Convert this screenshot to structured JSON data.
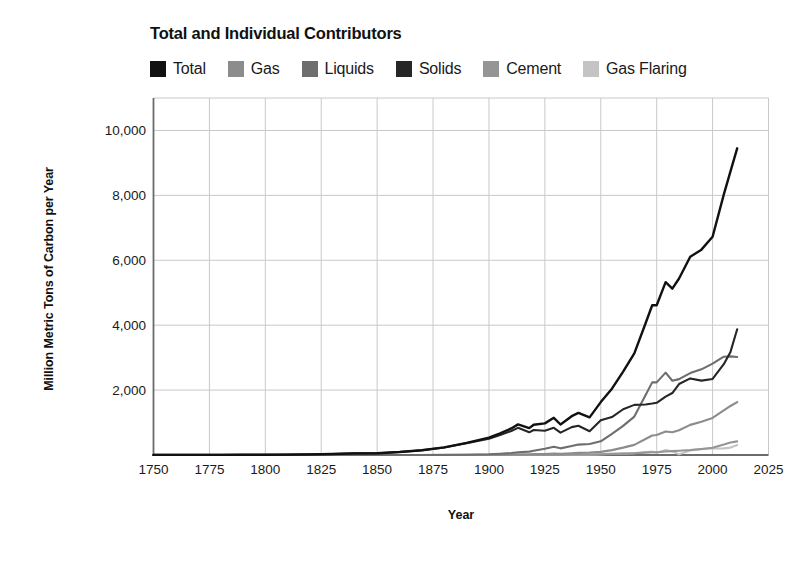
{
  "chart_data": {
    "type": "line",
    "title": "Total and Individual Contributors",
    "xlabel": "Year",
    "ylabel": "Million Metric Tons of Carbon per Year",
    "xlim": [
      1750,
      2025
    ],
    "ylim": [
      0,
      11000
    ],
    "xticks": [
      1750,
      1775,
      1800,
      1825,
      1850,
      1875,
      1900,
      1925,
      1950,
      1975,
      2000,
      2025
    ],
    "xtick_labels": [
      "1750",
      "1775",
      "1800",
      "1825",
      "1850",
      "1875",
      "1900",
      "1925",
      "1950",
      "1975",
      "2000",
      "2025"
    ],
    "yticks": [
      2000,
      4000,
      6000,
      8000,
      10000
    ],
    "ytick_labels": [
      "2,000",
      "4,000",
      "6,000",
      "8,000",
      "10,000"
    ],
    "grid": true,
    "legend_position": "top",
    "x": [
      1750,
      1760,
      1770,
      1780,
      1790,
      1800,
      1810,
      1820,
      1830,
      1840,
      1850,
      1860,
      1870,
      1880,
      1890,
      1900,
      1905,
      1910,
      1913,
      1918,
      1920,
      1925,
      1929,
      1932,
      1937,
      1940,
      1945,
      1950,
      1955,
      1960,
      1965,
      1970,
      1973,
      1975,
      1979,
      1982,
      1985,
      1990,
      1995,
      2000,
      2005,
      2008,
      2011
    ],
    "series": [
      {
        "name": "Total",
        "color": "#111111",
        "values": [
          3,
          3,
          4,
          5,
          8,
          8,
          13,
          18,
          31,
          50,
          54,
          91,
          147,
          236,
          375,
          534,
          670,
          819,
          944,
          827,
          932,
          975,
          1145,
          940,
          1196,
          1299,
          1160,
          1630,
          2043,
          2569,
          3130,
          4053,
          4613,
          4615,
          5326,
          5127,
          5438,
          6109,
          6327,
          6724,
          8023,
          8738,
          9449
        ]
      },
      {
        "name": "Gas",
        "color": "#8c8c8c",
        "values": [
          0,
          0,
          0,
          0,
          0,
          0,
          0,
          0,
          0,
          0,
          0,
          0,
          0,
          1,
          3,
          9,
          13,
          18,
          22,
          22,
          26,
          33,
          47,
          38,
          54,
          64,
          74,
          97,
          150,
          227,
          312,
          493,
          600,
          614,
          724,
          699,
          764,
          928,
          1027,
          1143,
          1372,
          1510,
          1630
        ]
      },
      {
        "name": "Liquids",
        "color": "#6e6e6e",
        "values": [
          0,
          0,
          0,
          0,
          0,
          0,
          0,
          0,
          0,
          0,
          0,
          0,
          1,
          3,
          10,
          24,
          39,
          60,
          83,
          104,
          131,
          191,
          254,
          205,
          275,
          321,
          341,
          423,
          653,
          898,
          1184,
          1839,
          2238,
          2237,
          2537,
          2289,
          2338,
          2525,
          2639,
          2815,
          3029,
          3038,
          3020
        ]
      },
      {
        "name": "Solids",
        "color": "#262626",
        "values": [
          3,
          3,
          4,
          5,
          8,
          8,
          13,
          18,
          31,
          50,
          54,
          91,
          146,
          232,
          362,
          501,
          617,
          739,
          837,
          699,
          772,
          747,
          836,
          688,
          858,
          903,
          733,
          1070,
          1170,
          1410,
          1544,
          1556,
          1586,
          1609,
          1799,
          1910,
          2186,
          2360,
          2292,
          2342,
          2797,
          3177,
          3873
        ]
      },
      {
        "name": "Cement",
        "color": "#959595",
        "values": [
          0,
          0,
          0,
          0,
          0,
          0,
          0,
          0,
          0,
          0,
          0,
          0,
          0,
          0,
          0,
          0,
          1,
          2,
          2,
          2,
          3,
          4,
          8,
          5,
          9,
          11,
          7,
          18,
          29,
          43,
          55,
          73,
          85,
          85,
          109,
          118,
          131,
          154,
          187,
          226,
          322,
          385,
          420
        ]
      },
      {
        "name": "Gas Flaring",
        "color": "#c4c4c4",
        "values": [
          0,
          0,
          0,
          0,
          0,
          0,
          0,
          0,
          0,
          0,
          0,
          0,
          0,
          0,
          0,
          0,
          0,
          0,
          0,
          0,
          0,
          0,
          0,
          4,
          0,
          0,
          5,
          23,
          41,
          41,
          55,
          92,
          104,
          70,
          157,
          111,
          19,
          142,
          182,
          198,
          203,
          228,
          306
        ]
      }
    ]
  },
  "legend": [
    {
      "label": "Total",
      "color": "#111111",
      "icon": "legend-swatch-total"
    },
    {
      "label": "Gas",
      "color": "#8c8c8c",
      "icon": "legend-swatch-gas"
    },
    {
      "label": "Liquids",
      "color": "#6e6e6e",
      "icon": "legend-swatch-liquids"
    },
    {
      "label": "Solids",
      "color": "#262626",
      "icon": "legend-swatch-solids"
    },
    {
      "label": "Cement",
      "color": "#959595",
      "icon": "legend-swatch-cement"
    },
    {
      "label": "Gas Flaring",
      "color": "#c4c4c4",
      "icon": "legend-swatch-gas-flaring"
    }
  ],
  "style": {
    "axis_color": "#6b6b6b",
    "grid_color": "#c9c9c9",
    "background": "#ffffff"
  }
}
